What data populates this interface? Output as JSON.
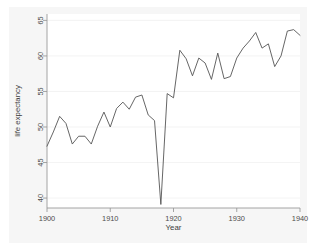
{
  "chart_data": {
    "type": "line",
    "title": "",
    "subtitle": "",
    "xlabel": "Year",
    "ylabel": "life expectancy",
    "xlim": [
      1900,
      1940
    ],
    "ylim": [
      38.6,
      65.9
    ],
    "xticks": [
      1900,
      1910,
      1920,
      1930,
      1940
    ],
    "xtick_labels": [
      "1900",
      "1910",
      "1920",
      "1930",
      "1940"
    ],
    "yticks": [
      40,
      45,
      50,
      55,
      60,
      65
    ],
    "ytick_labels": [
      "40",
      "45",
      "50",
      "55",
      "60",
      "65"
    ],
    "grid": "horizontal-faint",
    "legend": "none",
    "legend_position": "none",
    "series": [
      {
        "name": "life expectancy",
        "color": "#555555",
        "x": [
          1900,
          1901,
          1902,
          1903,
          1904,
          1905,
          1906,
          1907,
          1908,
          1909,
          1910,
          1911,
          1912,
          1913,
          1914,
          1915,
          1916,
          1917,
          1918,
          1919,
          1920,
          1921,
          1922,
          1923,
          1924,
          1925,
          1926,
          1927,
          1928,
          1929,
          1930,
          1931,
          1932,
          1933,
          1934,
          1935,
          1936,
          1937,
          1938,
          1939,
          1940
        ],
        "values": [
          47.3,
          49.3,
          51.5,
          50.5,
          47.6,
          48.7,
          48.7,
          47.6,
          50.1,
          52.1,
          50.0,
          52.6,
          53.5,
          52.5,
          54.2,
          54.5,
          51.7,
          50.9,
          39.1,
          54.7,
          54.1,
          60.8,
          59.6,
          57.2,
          59.7,
          59.0,
          56.7,
          60.4,
          56.8,
          57.1,
          59.7,
          61.1,
          62.1,
          63.3,
          61.1,
          61.7,
          58.5,
          60.0,
          63.5,
          63.7,
          62.9
        ]
      }
    ],
    "annotations": []
  },
  "axes": {
    "x_title": "Year",
    "y_title": "life expectancy"
  }
}
